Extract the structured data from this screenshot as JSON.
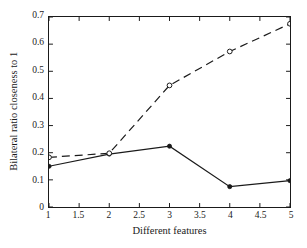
{
  "chart_data": {
    "type": "line",
    "title": "",
    "xlabel": "Different features",
    "ylabel": "Bilateral ratio closeness to 1",
    "xlim": [
      1,
      5
    ],
    "ylim": [
      0,
      0.7
    ],
    "grid": false,
    "legend": "none",
    "x": [
      1,
      2,
      3,
      4,
      5
    ],
    "xticks": [
      "1",
      "1.5",
      "2",
      "2.5",
      "3",
      "3.5",
      "4",
      "4.5",
      "5"
    ],
    "xtick_values": [
      1,
      1.5,
      2,
      2.5,
      3,
      3.5,
      4,
      4.5,
      5
    ],
    "yticks": [
      "0",
      "0.1",
      "0.2",
      "0.3",
      "0.4",
      "0.5",
      "0.6",
      "0.7"
    ],
    "ytick_values": [
      0,
      0.1,
      0.2,
      0.3,
      0.4,
      0.5,
      0.6,
      0.7
    ],
    "series": [
      {
        "name": "solid-series",
        "style": "solid",
        "marker": "filled-circle",
        "color": "#1a1a1a",
        "values": [
          0.15,
          0.195,
          0.224,
          0.075,
          0.097
        ]
      },
      {
        "name": "dashed-series",
        "style": "dashed",
        "marker": "open-circle",
        "color": "#1a1a1a",
        "values": [
          0.183,
          0.198,
          0.448,
          0.573,
          0.675
        ]
      }
    ]
  },
  "figure": {
    "background_color": "#ffffff",
    "axis_color": "#1a1a1a"
  }
}
